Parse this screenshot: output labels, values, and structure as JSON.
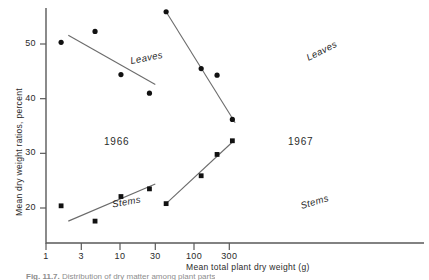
{
  "figure": {
    "caption_prefix": "Fig. 11.7.",
    "caption_text": "Distribution of dry matter among plant parts"
  },
  "chart_data": {
    "type": "scatter",
    "title": "",
    "xlabel": "Mean total plant dry weight (g)",
    "ylabel": "Mean dry weight ratios, percent",
    "xscale": "log",
    "yticks": [
      20,
      30,
      40,
      50
    ],
    "xticks": [
      1,
      3,
      10,
      30,
      100,
      300
    ],
    "ylim": [
      15,
      57
    ],
    "grid": false,
    "legend": "inline-labels",
    "panels": [
      {
        "name": "1966",
        "label": "1966",
        "series": [
          {
            "name": "Leaves",
            "label": "Leaves",
            "marker": "circle",
            "x": [
              1.6,
              4.6,
              10.3,
              25.0
            ],
            "y": [
              50.3,
              52.3,
              44.4,
              41.0
            ],
            "fit_x": [
              2.0,
              30.0
            ],
            "fit_y": [
              51.6,
              42.6
            ]
          },
          {
            "name": "Stems",
            "label": "Stems",
            "marker": "square",
            "x": [
              1.6,
              4.6,
              10.3,
              25.0
            ],
            "y": [
              20.4,
              17.6,
              22.1,
              23.5
            ],
            "fit_x": [
              2.0,
              30.0
            ],
            "fit_y": [
              17.6,
              24.4
            ]
          }
        ]
      },
      {
        "name": "1967",
        "label": "1967",
        "series": [
          {
            "name": "Leaves",
            "label": "Leaves",
            "marker": "circle",
            "x": [
              42.0,
              125.0,
              205.0,
              330.0
            ],
            "y": [
              55.9,
              45.5,
              44.3,
              36.2
            ],
            "fit_x": [
              42.0,
              360.0
            ],
            "fit_y": [
              55.9,
              35.6
            ]
          },
          {
            "name": "Stems",
            "label": "Stems",
            "marker": "square",
            "x": [
              42.0,
              125.0,
              205.0,
              330.0
            ],
            "y": [
              20.8,
              25.9,
              29.8,
              32.3
            ],
            "fit_x": [
              42.0,
              345.0
            ],
            "fit_y": [
              20.8,
              32.3
            ]
          }
        ]
      }
    ]
  }
}
